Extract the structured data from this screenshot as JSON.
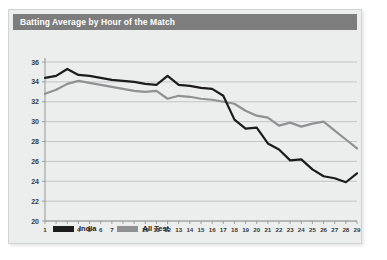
{
  "card": {
    "background_color": "#eceded",
    "border_color": "#d2d4d4"
  },
  "header": {
    "title": "Batting Average by Hour of the Match",
    "bar_color": "#7d7d7d",
    "text_color": "#ffffff"
  },
  "legend": {
    "position": "bottom-left",
    "items": [
      {
        "label": "India",
        "color": "#1c1c1c"
      },
      {
        "label": "All Test",
        "color": "#8f9192"
      }
    ]
  },
  "chart_data": {
    "type": "line",
    "title": "Batting Average by Hour of the Match",
    "xlabel": "",
    "ylabel": "",
    "xlim": [
      1,
      29
    ],
    "ylim": [
      20,
      36
    ],
    "grid": true,
    "y_ticks": [
      36,
      34,
      32,
      30,
      28,
      26,
      24,
      22,
      20
    ],
    "x_ticks": [
      1,
      2,
      3,
      4,
      5,
      6,
      7,
      8,
      9,
      10,
      11,
      12,
      13,
      14,
      15,
      16,
      17,
      18,
      19,
      20,
      21,
      22,
      23,
      24,
      25,
      26,
      27,
      28,
      29
    ],
    "categories": [
      1,
      2,
      3,
      4,
      5,
      6,
      7,
      8,
      9,
      10,
      11,
      12,
      13,
      14,
      15,
      16,
      17,
      18,
      19,
      20,
      21,
      22,
      23,
      24,
      25,
      26,
      27,
      28,
      29
    ],
    "series": [
      {
        "name": "India",
        "color": "#1c1c1c",
        "values": [
          34.4,
          34.6,
          35.3,
          34.7,
          34.6,
          34.4,
          34.2,
          34.1,
          34.0,
          33.8,
          33.7,
          34.6,
          33.7,
          33.6,
          33.4,
          33.3,
          32.6,
          30.2,
          29.3,
          29.4,
          27.8,
          27.2,
          26.1,
          26.2,
          25.2,
          24.5,
          24.3,
          23.9,
          24.8
        ]
      },
      {
        "name": "All Test",
        "color": "#8f9192",
        "values": [
          32.8,
          33.2,
          33.8,
          34.1,
          33.9,
          33.7,
          33.5,
          33.3,
          33.1,
          33.0,
          33.1,
          32.3,
          32.6,
          32.5,
          32.3,
          32.2,
          32.0,
          31.8,
          31.1,
          30.6,
          30.4,
          29.6,
          29.9,
          29.5,
          29.8,
          30.0,
          29.1,
          28.2,
          27.3
        ]
      }
    ]
  }
}
